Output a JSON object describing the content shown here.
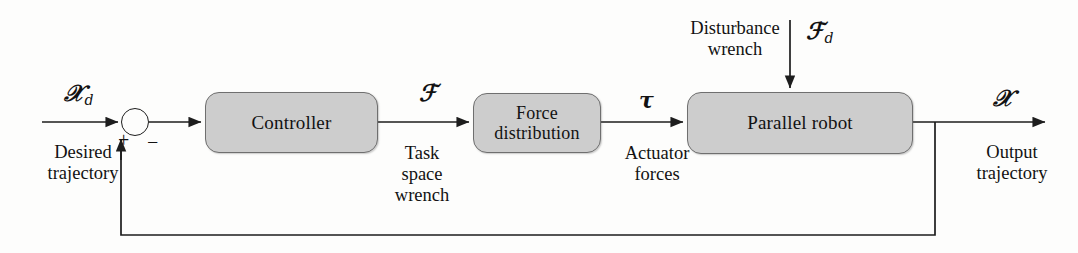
{
  "diagram": {
    "colors": {
      "background": "#fdfdfc",
      "block_fill": "#cdcdcd",
      "block_border": "#6f6f6f",
      "line": "#1d1d1d",
      "text": "#121212"
    }
  },
  "blocks": [
    {
      "id": "controller",
      "label": "Controller",
      "lines": [
        "Controller"
      ]
    },
    {
      "id": "force-dist",
      "label": "Force distribution",
      "lines": [
        "Force",
        "distribution"
      ]
    },
    {
      "id": "parallel-robot",
      "label": "Parallel robot",
      "lines": [
        "Parallel robot"
      ]
    }
  ],
  "signals": {
    "reference": {
      "symbol": "X",
      "subscript": "d",
      "caption_lines": [
        "Desired",
        "trajectory"
      ]
    },
    "task_space_wrench": {
      "symbol": "F",
      "subscript": "",
      "caption_lines": [
        "Task",
        "space",
        "wrench"
      ]
    },
    "actuator_forces": {
      "symbol": "t",
      "caption_lines": [
        "Actuator",
        "forces"
      ]
    },
    "disturbance": {
      "symbol": "F",
      "subscript": "d",
      "caption_lines": [
        "Disturbance",
        "wrench"
      ]
    },
    "output": {
      "symbol": "X",
      "subscript": "",
      "caption_lines": [
        "Output",
        "trajectory"
      ]
    }
  },
  "summing_junction": {
    "name": "summing-junction",
    "positive_sign": "+",
    "negative_sign": "−"
  }
}
